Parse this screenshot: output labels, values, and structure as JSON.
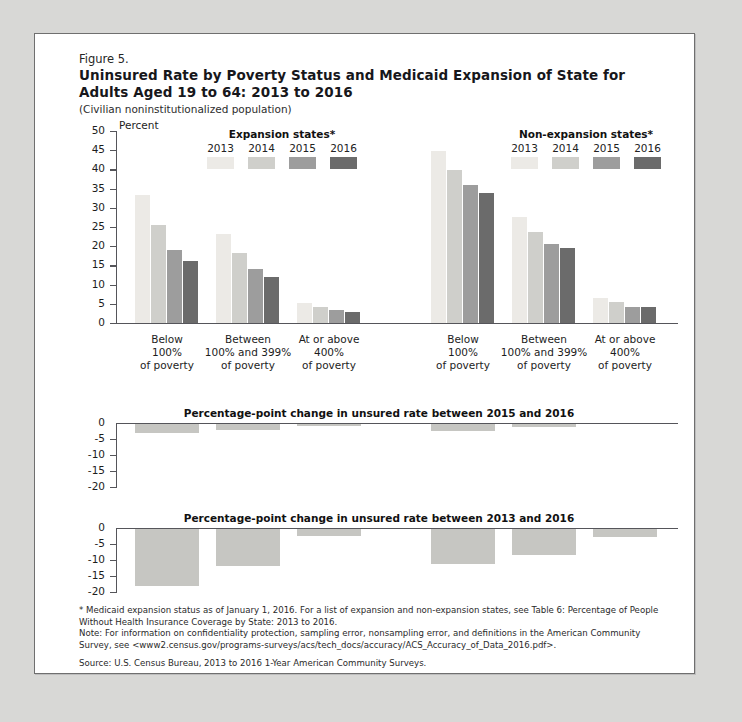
{
  "figure": {
    "number": "Figure 5.",
    "title": "Uninsured Rate by Poverty Status and Medicaid Expansion of State for Adults Aged 19 to 64: 2013 to 2016",
    "subtitle": "(Civilian noninstitutionalized population)",
    "axis_unit_label": "Percent"
  },
  "legends": {
    "expansion": {
      "title": "Expansion states*",
      "years": [
        "2013",
        "2014",
        "2015",
        "2016"
      ]
    },
    "non_expansion": {
      "title": "Non-expansion states*",
      "years": [
        "2013",
        "2014",
        "2015",
        "2016"
      ]
    }
  },
  "colors": {
    "y2013": "#eceae6",
    "y2014": "#cfcfcb",
    "y2015": "#9d9d9d",
    "y2016": "#6b6b6b",
    "delta_bar": "#c6c6c2",
    "axis": "#55555a",
    "border": "#6f6f6f",
    "page_bg": "#d8d8d6",
    "card_bg": "#ffffff"
  },
  "notes": {
    "footnote": "* Medicaid expansion status as of January 1, 2016. For a list of expansion and non-expansion states, see Table 6: Percentage of People Without Health Insurance Coverage by State: 2013 to 2016.",
    "note": "Note: For information on confidentiality protection, sampling error, nonsampling error, and definitions in the American Community Survey, see <www2.census.gov/programs-surveys/acs/tech_docs/accuracy/ACS_Accuracy_of_Data_2016.pdf>.",
    "source": "Source: U.S. Census Bureau, 2013 to 2016 1-Year American Community Surveys."
  },
  "chart_data": [
    {
      "type": "bar",
      "id": "uninsured-rate",
      "title": "Uninsured Rate by Poverty Status and Medicaid Expansion of State for Adults Aged 19 to 64: 2013 to 2016",
      "xlabel": "",
      "ylabel": "Percent",
      "ylim": [
        0,
        50
      ],
      "yticks": [
        50,
        45,
        40,
        35,
        30,
        25,
        20,
        15,
        10,
        5,
        0
      ],
      "grid": false,
      "legend_position": "top",
      "panels": [
        {
          "name": "Expansion states*",
          "categories": [
            "Below 100% of poverty",
            "Between 100% and 399% of poverty",
            "At or above 400% of poverty"
          ],
          "series": [
            {
              "name": "2013",
              "values": [
                33.3,
                23.3,
                5.1
              ]
            },
            {
              "name": "2014",
              "values": [
                25.4,
                18.2,
                4.2
              ]
            },
            {
              "name": "2015",
              "values": [
                19.0,
                14.0,
                3.4
              ]
            },
            {
              "name": "2016",
              "values": [
                16.2,
                12.0,
                2.9
              ]
            }
          ]
        },
        {
          "name": "Non-expansion states*",
          "categories": [
            "Below 100% of poverty",
            "Between 100% and 399% of poverty",
            "At or above 400% of poverty"
          ],
          "series": [
            {
              "name": "2013",
              "values": [
                44.7,
                27.6,
                6.5
              ]
            },
            {
              "name": "2014",
              "values": [
                39.8,
                23.6,
                5.5
              ]
            },
            {
              "name": "2015",
              "values": [
                36.0,
                20.5,
                4.3
              ]
            },
            {
              "name": "2016",
              "values": [
                33.8,
                19.5,
                4.1
              ]
            }
          ]
        }
      ]
    },
    {
      "type": "bar",
      "id": "change-2015-2016",
      "title": "Percentage-point change in unsured rate between 2015 and 2016",
      "title_display": "Percentage-point change in unsured rate between 2015 and 2016",
      "ylim": [
        -20,
        0
      ],
      "yticks": [
        0,
        -5,
        -10,
        -15,
        -20
      ],
      "ytick_labels": [
        "0",
        "-5",
        "-10",
        "-15",
        "-20"
      ],
      "grid": false,
      "categories": [
        "Expansion: Below 100% of poverty",
        "Expansion: Between 100% and 399% of poverty",
        "Expansion: At or above 400% of poverty",
        "Non-expansion: Below 100% of poverty",
        "Non-expansion: Between 100% and 399% of poverty",
        "Non-expansion: At or above 400% of poverty"
      ],
      "values": [
        -2.8,
        -2.0,
        -0.5,
        -2.2,
        -1.0,
        0.0
      ]
    },
    {
      "type": "bar",
      "id": "change-2013-2016",
      "title": "Percentage-point change in unsured rate between 2013 and 2016",
      "title_display": "Percentage-point change in unsured rate between 2013 and 2016",
      "ylim": [
        -20,
        0
      ],
      "yticks": [
        0,
        -5,
        -10,
        -15,
        -20
      ],
      "ytick_labels": [
        "0",
        "-5",
        "-10",
        "-15",
        "-20"
      ],
      "grid": false,
      "categories": [
        "Expansion: Below 100% of poverty",
        "Expansion: Between 100% and 399% of poverty",
        "Expansion: At or above 400% of poverty",
        "Non-expansion: Below 100% of poverty",
        "Non-expansion: Between 100% and 399% of poverty",
        "Non-expansion: At or above 400% of poverty"
      ],
      "values": [
        -17.8,
        -11.5,
        -2.2,
        -11.0,
        -8.0,
        -2.4
      ]
    }
  ],
  "panel_titles": {
    "delta1": "Percentage-point change in unsured rate between 2015 and 2016",
    "delta2": "Percentage-point change in unsured rate between 2013 and 2016"
  }
}
